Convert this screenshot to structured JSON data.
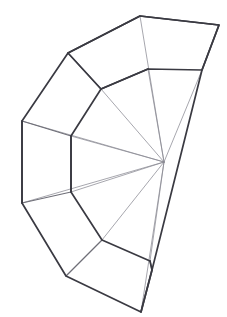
{
  "figure": {
    "title": "Unrolled fan net",
    "kind": "line-diagram",
    "background_color": "#ffffff",
    "outline_color": "#3a3a42",
    "rib_color": "#6f6f78",
    "spoke_color": "#8a8a93",
    "canvas": {
      "width": 227,
      "height": 317
    }
  },
  "geometry": {
    "hub": {
      "name": "apex",
      "x": 164,
      "y": 162
    },
    "outer_ring": [
      {
        "id": "o1",
        "x": 140,
        "y": 16
      },
      {
        "id": "o2",
        "x": 219,
        "y": 25
      },
      {
        "id": "o3",
        "x": 202,
        "y": 70
      },
      {
        "id": "o0",
        "x": 68,
        "y": 53
      },
      {
        "id": "oL1",
        "x": 22,
        "y": 121
      },
      {
        "id": "oL2",
        "x": 22,
        "y": 203
      },
      {
        "id": "oB1",
        "x": 66,
        "y": 276
      },
      {
        "id": "oB2",
        "x": 141,
        "y": 312
      },
      {
        "id": "oB3",
        "x": 152,
        "y": 270
      }
    ],
    "inner_ring": [
      {
        "id": "i0",
        "x": 148,
        "y": 69
      },
      {
        "id": "i1",
        "x": 101,
        "y": 89
      },
      {
        "id": "i2",
        "x": 71,
        "y": 136
      },
      {
        "id": "i3",
        "x": 71,
        "y": 192
      },
      {
        "id": "i4",
        "x": 102,
        "y": 240
      },
      {
        "id": "i5",
        "x": 150,
        "y": 261
      }
    ],
    "outline_path": "M 140 16 L 219 25 L 202 70 L 148 69 L 101 89 L 68 53 Z",
    "outer_boundary_path": "M 140 16 L 68 53 L 22 121 L 22 203 L 66 276 L 141 312 L 152 270 L 202 70 L 219 25 Z",
    "inner_arc_path": "M 148 69 L 101 89 L 71 136 L 71 192 L 102 240 L 150 261",
    "ribs": [
      {
        "name": "rib-top",
        "from": "o0",
        "to": "i1"
      },
      {
        "name": "rib-upper-left",
        "from": "oL1",
        "to": "i2"
      },
      {
        "name": "rib-lower-left",
        "from": "oL2",
        "to": "i3"
      },
      {
        "name": "rib-bottom",
        "from": "oB1",
        "to": "i4"
      },
      {
        "name": "rib-bottom-right",
        "from": "oB3",
        "to": "i5"
      }
    ],
    "spokes": [
      {
        "name": "spoke-1",
        "to": {
          "x": 140,
          "y": 16
        }
      },
      {
        "name": "spoke-2",
        "to": {
          "x": 148,
          "y": 69
        }
      },
      {
        "name": "spoke-3",
        "to": {
          "x": 101,
          "y": 89
        }
      },
      {
        "name": "spoke-4",
        "to": {
          "x": 71,
          "y": 136
        }
      },
      {
        "name": "spoke-5",
        "to": {
          "x": 71,
          "y": 192
        }
      },
      {
        "name": "spoke-6",
        "to": {
          "x": 102,
          "y": 240
        }
      },
      {
        "name": "spoke-7",
        "to": {
          "x": 150,
          "y": 261
        }
      },
      {
        "name": "spoke-8",
        "to": {
          "x": 141,
          "y": 312
        }
      },
      {
        "name": "spoke-9",
        "to": {
          "x": 202,
          "y": 70
        }
      },
      {
        "name": "spoke-10",
        "to": {
          "x": 22,
          "y": 121
        }
      },
      {
        "name": "spoke-11",
        "to": {
          "x": 22,
          "y": 203
        }
      }
    ]
  },
  "labels": {
    "none_visible": ""
  }
}
